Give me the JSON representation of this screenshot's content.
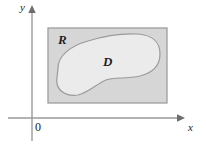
{
  "figure": {
    "type": "math-diagram",
    "width": 206,
    "height": 147,
    "background_color": "#ffffff"
  },
  "axes": {
    "x_axis": {
      "label": "x",
      "icon": "arrow-right-icon",
      "color": "#9a9a9a",
      "y_pixel": 118,
      "x_start": 8,
      "x_end": 183
    },
    "y_axis": {
      "label": "y",
      "icon": "arrow-up-icon",
      "color": "#9a9a9a",
      "x_pixel": 32,
      "y_start": 8,
      "y_end": 141
    },
    "origin": {
      "label": "0",
      "x_pixel": 32,
      "y_pixel": 118
    }
  },
  "regions": [
    {
      "id": "R",
      "label": "R",
      "shape": "rectangle",
      "fill_color": "#d6d6d6",
      "stroke_color": "#9d9d9d",
      "bounds": {
        "left": 48,
        "top": 28,
        "right": 167,
        "bottom": 103
      },
      "label_position": {
        "x": 58,
        "y": 33
      }
    },
    {
      "id": "D",
      "label": "D",
      "shape": "closed-curve",
      "fill_color": "#ebebeb",
      "stroke_color": "#9a9a9a",
      "label_position": {
        "x": 103,
        "y": 55
      },
      "path": "M 58 68 C 58 56, 70 46, 88 41 C 104 36, 122 33, 138 34 C 152 35, 160 42, 160 54 C 160 66, 152 73, 140 76 C 126 79, 114 77, 106 80 C 96 84, 90 92, 78 95 C 68 97, 59 92, 57 84 C 56 78, 58 73, 58 68 Z"
    }
  ],
  "chart_data": {
    "type": "diagram",
    "title": "",
    "xlabel": "x",
    "ylabel": "y",
    "annotations": [
      "R",
      "D",
      "0"
    ],
    "grid": false,
    "legend": "none"
  }
}
